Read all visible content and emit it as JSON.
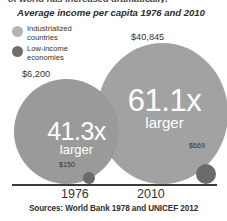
{
  "headline_fragment": "of world has increased dramatically.",
  "subtitle": "Average income per capita 1976 and 2010",
  "legend": {
    "items": [
      {
        "label": "Industrialized countries",
        "swatch": "light-gray-circle-icon",
        "color": "#b4b4b4"
      },
      {
        "label": "Low-income economies",
        "swatch": "dark-gray-circle-icon",
        "color": "#6e6e6e"
      }
    ]
  },
  "labels": {
    "industrialized_2010": "$40,845",
    "industrialized_1976": "$6,200",
    "lowincome_1976": "$150",
    "lowincome_2010": "$669"
  },
  "bubbles": {
    "y1976": {
      "multiplier": "41.3x",
      "caption": "larger",
      "color": "#9a9a9a"
    },
    "y2010": {
      "multiplier": "61.1x",
      "caption": "larger",
      "color": "#a2a2a2"
    }
  },
  "axis": {
    "years": [
      "1976",
      "2010"
    ]
  },
  "source": "Sources: World Bank 1978 and UNICEF 2012",
  "chart_data": {
    "type": "bubble",
    "title": "Average income per capita 1976 and 2010",
    "categories": [
      "1976",
      "2010"
    ],
    "series": [
      {
        "name": "Industrialized countries",
        "color": "#9a9a9a",
        "values": [
          6200,
          40845
        ],
        "value_labels": [
          "$6,200",
          "$40,845"
        ]
      },
      {
        "name": "Low-income economies",
        "color": "#6b6b6b",
        "values": [
          150,
          669
        ],
        "value_labels": [
          "$150",
          "$669"
        ]
      }
    ],
    "annotations": [
      {
        "category": "1976",
        "text": "41.3x larger",
        "ratio": 41.3
      },
      {
        "category": "2010",
        "text": "61.1x larger",
        "ratio": 61.1
      }
    ],
    "xlabel": "",
    "ylabel": "",
    "grid": false,
    "legend_position": "top-left",
    "source": "Sources: World Bank 1978 and UNICEF 2012"
  }
}
